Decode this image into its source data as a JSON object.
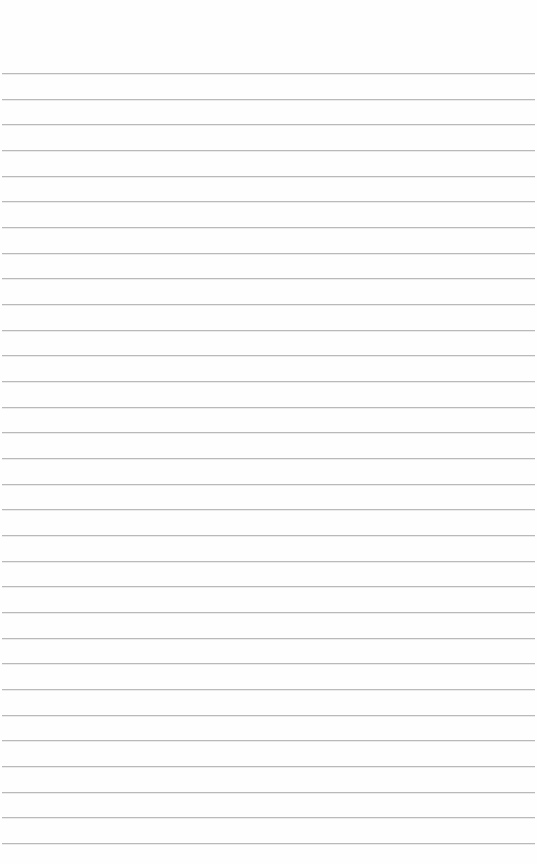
{
  "page": {
    "type": "lined-paper",
    "background_color": "#fefefe",
    "rule_color": "#b9b9b9",
    "first_rule_y": 73,
    "rule_spacing": 25.67,
    "rule_count": 31,
    "text": ""
  }
}
